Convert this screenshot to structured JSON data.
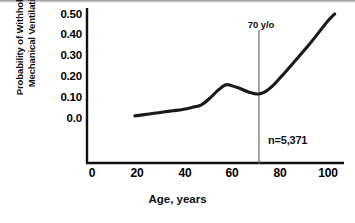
{
  "chart_data": {
    "type": "line",
    "title": "",
    "xlabel": "Age, years",
    "ylabel": "Probability of Withholding Mechanical Ventilation",
    "ylabel_line1": "Probability of Withholding",
    "ylabel_line2": "Mechanical Ventilation",
    "xlim": [
      0,
      100
    ],
    "ylim": [
      0.0,
      0.5
    ],
    "grid": false,
    "legend": "none",
    "xticks": [
      "0",
      "20",
      "40",
      "60",
      "80",
      "100"
    ],
    "xtick_values": [
      0,
      20,
      40,
      60,
      80,
      100
    ],
    "yticks": [
      "0.0",
      "0.10",
      "0.20",
      "0.30",
      "0.40",
      "0.50"
    ],
    "ytick_values": [
      0.0,
      0.1,
      0.2,
      0.3,
      0.4,
      0.5
    ],
    "series": [
      {
        "name": "Probability of withholding mechanical ventilation",
        "color": "#1a1a1a",
        "x": [
          18,
          22,
          26,
          30,
          34,
          38,
          42,
          46,
          50,
          53,
          56,
          58,
          62,
          66,
          70,
          73,
          76,
          80,
          85,
          90,
          95,
          99,
          102
        ],
        "values": [
          0.105,
          0.11,
          0.115,
          0.12,
          0.125,
          0.13,
          0.138,
          0.148,
          0.178,
          0.205,
          0.225,
          0.224,
          0.212,
          0.197,
          0.19,
          0.2,
          0.222,
          0.262,
          0.315,
          0.368,
          0.425,
          0.472,
          0.5
        ]
      }
    ],
    "annotations": [
      {
        "name": "age-70-marker",
        "label": "70 y/o",
        "x_value": 70,
        "type": "vertical-line"
      },
      {
        "name": "sample-size",
        "label": "n=5,371",
        "type": "text"
      }
    ]
  }
}
